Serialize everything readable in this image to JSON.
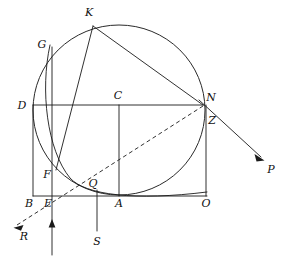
{
  "figure": {
    "background_color": "#ffffff",
    "line_color": "#1a1a1a",
    "stroke_width": 0.9
  },
  "labels": {
    "K": "K",
    "G": "G",
    "D": "D",
    "C": "C",
    "N": "N",
    "Z": "Z",
    "F": "F",
    "Q": "Q",
    "B": "B",
    "E": "E",
    "A": "A",
    "O": "O",
    "P": "P",
    "R": "R",
    "S": "S"
  },
  "points": {
    "K": {
      "x": 93,
      "y": 26,
      "label_x": 89,
      "label_y": 16
    },
    "G": {
      "x": 52,
      "y": 47,
      "label_x": 41,
      "label_y": 47
    },
    "D": {
      "x": 33,
      "y": 105,
      "label_x": 21,
      "label_y": 109
    },
    "C": {
      "x": 119,
      "y": 105,
      "label_x": 114,
      "label_y": 99
    },
    "N": {
      "x": 203,
      "y": 105,
      "label_x": 207,
      "label_y": 102
    },
    "Z": {
      "x": 206,
      "y": 117,
      "label_x": 208,
      "label_y": 122
    },
    "F": {
      "x": 57,
      "y": 169,
      "label_x": 45,
      "label_y": 176
    },
    "Q": {
      "x": 97,
      "y": 190,
      "label_x": 91,
      "label_y": 186
    },
    "B": {
      "x": 33,
      "y": 196,
      "label_x": 25,
      "label_y": 206
    },
    "E": {
      "x": 52,
      "y": 196,
      "label_x": 45,
      "label_y": 206
    },
    "A": {
      "x": 119,
      "y": 196,
      "label_x": 116,
      "label_y": 206
    },
    "O": {
      "x": 206,
      "y": 196,
      "label_x": 202,
      "label_y": 206
    },
    "P": {
      "x": 263,
      "y": 158,
      "label_x": 268,
      "label_y": 172
    },
    "R": {
      "x": 14,
      "y": 227,
      "label_x": 21,
      "label_y": 239
    },
    "S": {
      "x": 97,
      "y": 231,
      "label_x": 93,
      "label_y": 245
    }
  },
  "circle": {
    "cx": 119,
    "cy": 110,
    "r": 86,
    "description": "main circle through K, G, N, Q region"
  },
  "segments": [
    {
      "name": "D-to-N horizontal chord",
      "from": "D",
      "to": "N",
      "style": "solid"
    },
    {
      "name": "B-to-A baseline",
      "from": "B",
      "to": "A",
      "style": "solid"
    },
    {
      "name": "D-to-B left vertical",
      "from": "D",
      "to": "B",
      "style": "solid"
    },
    {
      "name": "C-to-A vertical",
      "from": "C",
      "to": "A",
      "style": "solid"
    },
    {
      "name": "N-to-O right vertical",
      "from": "N",
      "to": "O",
      "style": "solid"
    },
    {
      "name": "G-to-E vertical",
      "from": "G",
      "to": "E",
      "style": "solid"
    },
    {
      "name": "K-to-N chord",
      "from": "K",
      "to": "N",
      "style": "solid"
    },
    {
      "name": "K-to-F chord",
      "from": "K",
      "to": "F",
      "style": "solid"
    },
    {
      "name": "Q-to-N dashed",
      "from": "Q",
      "to": "N",
      "style": "dashed"
    }
  ],
  "rays": [
    {
      "name": "ray-N-to-P",
      "from": "N",
      "to": "P",
      "style": "solid",
      "arrow": "end"
    },
    {
      "name": "ray-Q-to-R",
      "from": "Q",
      "to": "R",
      "style": "dashed",
      "arrow": "end"
    },
    {
      "name": "ray-E-upward",
      "from": "E",
      "to": "E",
      "style": "solid",
      "arrow": "up"
    },
    {
      "name": "ray-Q-to-S",
      "from": "Q",
      "to": "S",
      "style": "solid",
      "arrow": "none"
    }
  ],
  "arcs": [
    {
      "name": "arc-G-F-Q",
      "description": "curved arc descending from G through F to Q and onward right"
    }
  ]
}
